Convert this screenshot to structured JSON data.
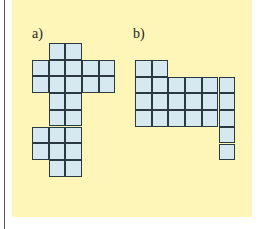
{
  "figures": [
    {
      "label": "a)",
      "label_pos": [
        32,
        26
      ],
      "origin": [
        32,
        43
      ],
      "cell": 16.7,
      "cells": [
        [
          1,
          0
        ],
        [
          2,
          0
        ],
        [
          0,
          1
        ],
        [
          1,
          1
        ],
        [
          2,
          1
        ],
        [
          3,
          1
        ],
        [
          4,
          1
        ],
        [
          0,
          2
        ],
        [
          1,
          2
        ],
        [
          2,
          2
        ],
        [
          3,
          2
        ],
        [
          4,
          2
        ],
        [
          1,
          3
        ],
        [
          2,
          3
        ],
        [
          1,
          4
        ],
        [
          2,
          4
        ],
        [
          0,
          5
        ],
        [
          1,
          5
        ],
        [
          2,
          5
        ],
        [
          0,
          6
        ],
        [
          1,
          6
        ],
        [
          2,
          6
        ],
        [
          1,
          7
        ],
        [
          2,
          7
        ]
      ]
    },
    {
      "label": "b)",
      "label_pos": [
        133,
        26
      ],
      "origin": [
        135,
        60
      ],
      "cell": 16.7,
      "cells": [
        [
          0,
          0
        ],
        [
          1,
          0
        ],
        [
          0,
          1
        ],
        [
          1,
          1
        ],
        [
          2,
          1
        ],
        [
          3,
          1
        ],
        [
          4,
          1
        ],
        [
          5,
          1
        ],
        [
          0,
          2
        ],
        [
          1,
          2
        ],
        [
          2,
          2
        ],
        [
          3,
          2
        ],
        [
          4,
          2
        ],
        [
          5,
          2
        ],
        [
          0,
          3
        ],
        [
          1,
          3
        ],
        [
          2,
          3
        ],
        [
          3,
          3
        ],
        [
          4,
          3
        ],
        [
          5,
          3
        ],
        [
          5,
          4
        ],
        [
          5,
          5
        ]
      ]
    }
  ],
  "colors": {
    "panel": "#fdf6b8",
    "cell_fill": "#d6e9f0",
    "cell_border": "#2a3a40"
  }
}
